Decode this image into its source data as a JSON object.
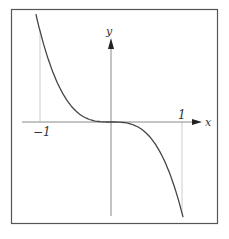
{
  "chart_data": {
    "type": "line",
    "title": "",
    "function": "y = -x^3",
    "xlabel": "x",
    "ylabel": "y",
    "x_ticks": [
      {
        "value": -1,
        "label": "−1"
      },
      {
        "value": 1,
        "label": "1"
      }
    ],
    "xlim": [
      -1.1,
      1.1
    ],
    "ylim": [
      -1.0,
      1.0
    ],
    "grid": false,
    "guide_lines": [
      {
        "x": -1
      },
      {
        "x": 1
      }
    ],
    "series": [
      {
        "name": "curve",
        "x": [
          -1.0,
          -0.8,
          -0.6,
          -0.4,
          -0.2,
          0.0,
          0.2,
          0.4,
          0.6,
          0.8,
          1.05
        ],
        "y": [
          1.0,
          0.512,
          0.216,
          0.064,
          0.008,
          0.0,
          -0.008,
          -0.064,
          -0.216,
          -0.512,
          -1.158
        ]
      }
    ]
  },
  "labels": {
    "x_axis": "x",
    "y_axis": "y",
    "tick_neg1": "−1",
    "tick_pos1": "1"
  },
  "colors": {
    "frame": "#555555",
    "axis": "#777777",
    "guide": "#cccccc",
    "curve": "#444444"
  }
}
